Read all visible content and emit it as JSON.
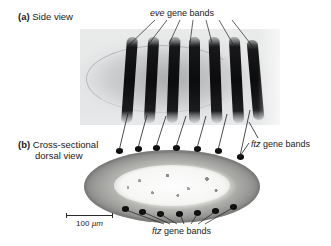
{
  "figure": {
    "background_color": "#ffffff",
    "line_color": "#1f1f1f",
    "panels": [
      {
        "tag": "(a)",
        "caption": "Side view",
        "view": "side view",
        "image_kind": "micrograph",
        "description": "Drosophila embryo side view with seven dark eve expression stripes"
      },
      {
        "tag": "(b)",
        "caption_line1": "Cross-sectional",
        "caption_line2": "dorsal view",
        "view": "cross-sectional dorsal view",
        "image_kind": "micrograph",
        "description": "Elongated oval embryo cross-section with dark ftz bands around the periphery"
      }
    ],
    "annotations": [
      {
        "id": "eve-label",
        "gene": "eve",
        "rest": " gene bands",
        "position": "top-center",
        "leader_count": 7,
        "points_to": "panel-a-stripes"
      },
      {
        "id": "ftz-label-right",
        "gene": "ftz",
        "rest": " gene bands",
        "position": "middle-right",
        "leader_count": 2,
        "points_to": "panel-b-upper-dots"
      },
      {
        "id": "ftz-label-bottom",
        "gene": "ftz",
        "rest": " gene bands",
        "position": "bottom-center",
        "leader_count": 7,
        "points_to": "panel-b-lower-dots"
      }
    ],
    "scale_bar": {
      "value": "100",
      "unit": "µm",
      "label": "100 µm",
      "length_px": 47,
      "position": "below-panel-b-left"
    },
    "band_counts": {
      "panel_a_stripes": 7,
      "panel_b_upper_dots": 7,
      "panel_b_lower_dots": 7,
      "connector_lines": 7
    }
  }
}
